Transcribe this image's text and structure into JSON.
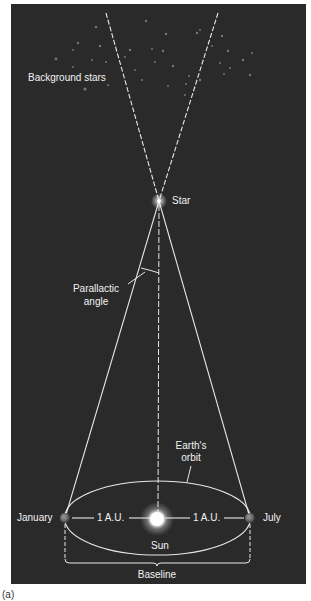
{
  "figure": {
    "caption": "(a)",
    "colors": {
      "background": "#2a2a2a",
      "line": "#e8e8e8",
      "text": "#f2f2f2",
      "page": "#ffffff"
    },
    "labels": {
      "background_stars": "Background stars",
      "star": "Star",
      "parallactic_angle_line1": "Parallactic",
      "parallactic_angle_line2": "angle",
      "earths_orbit_line1": "Earth's",
      "earths_orbit_line2": "orbit",
      "january": "January",
      "july": "July",
      "au_left": "1 A.U.",
      "au_right": "1 A.U.",
      "sun": "Sun",
      "baseline": "Baseline"
    }
  }
}
